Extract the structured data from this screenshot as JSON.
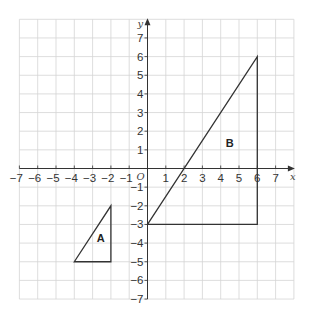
{
  "diagram": {
    "type": "coordinate-grid",
    "x_axis": {
      "label": "x",
      "min": -7,
      "max": 7,
      "ticks": [
        -7,
        -6,
        -5,
        -4,
        -3,
        -2,
        -1,
        1,
        2,
        3,
        4,
        5,
        6,
        7
      ]
    },
    "y_axis": {
      "label": "y",
      "min": -7,
      "max": 7,
      "ticks": [
        -7,
        -6,
        -5,
        -4,
        -3,
        -2,
        -1,
        1,
        2,
        3,
        4,
        5,
        6,
        7
      ]
    },
    "origin_label": "O",
    "grid": {
      "x_from": -7,
      "x_to": 8,
      "y_from": -7,
      "y_to": 8
    },
    "shapes": [
      {
        "name": "A",
        "vertices": [
          [
            -4,
            -5
          ],
          [
            -2,
            -2
          ],
          [
            -2,
            -5
          ]
        ],
        "label_pos": [
          -2.55,
          -3.75
        ]
      },
      {
        "name": "B",
        "vertices": [
          [
            0,
            -3
          ],
          [
            6,
            6
          ],
          [
            6,
            -3
          ]
        ],
        "label_pos": [
          4.5,
          1.35
        ]
      }
    ]
  },
  "colors": {
    "grid": "#d4d4d4",
    "axis": "#333333",
    "shape": "#333333",
    "background": "#ffffff"
  }
}
